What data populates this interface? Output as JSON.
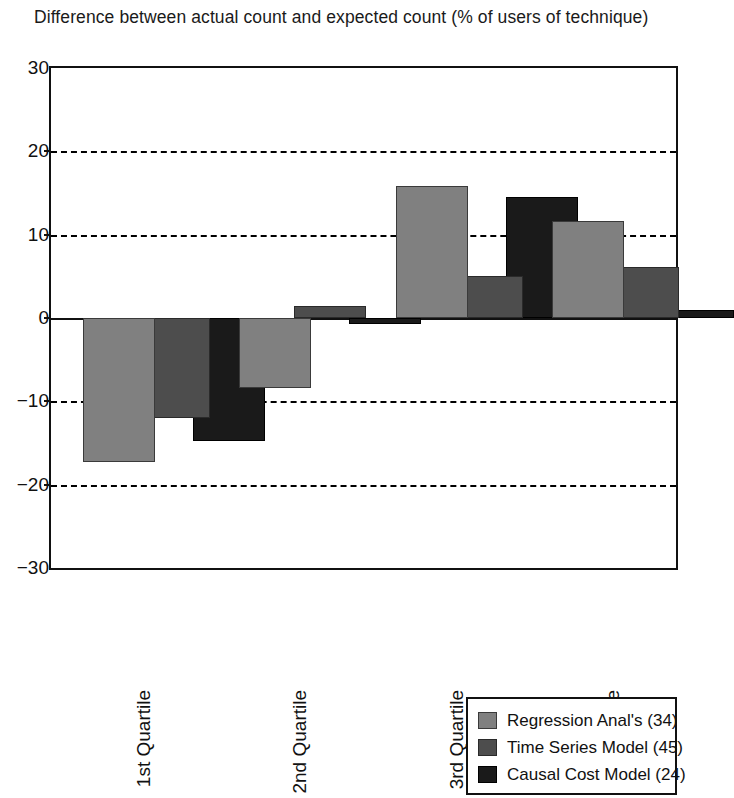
{
  "chart_data": {
    "type": "bar",
    "title": "Difference between actual count and expected count (% of users of technique)",
    "xlabel": "",
    "ylabel": "",
    "ylim": [
      -30,
      30
    ],
    "yticks": [
      30,
      20,
      10,
      0,
      -10,
      -20,
      -30
    ],
    "ytick_labels": [
      "30",
      "20",
      "10",
      "0",
      "−10",
      "−20",
      "−30"
    ],
    "grid": true,
    "grid_axis": "y",
    "legend_position": "bottom-right",
    "categories": [
      "1st Quartile",
      "2nd Quartile",
      "3rd Quartile",
      "4th Quartile"
    ],
    "series": [
      {
        "name": "Regression Anal's (34)",
        "color": "#808080",
        "values": [
          -17.3,
          -8.4,
          15.8,
          11.7
        ]
      },
      {
        "name": "Time Series Model (45)",
        "color": "#4d4d4d",
        "values": [
          -12.0,
          1.5,
          5.0,
          6.1
        ]
      },
      {
        "name": "Causal Cost Model (24)",
        "color": "#1a1a1a",
        "values": [
          -14.7,
          -0.7,
          14.5,
          1.0
        ]
      }
    ]
  },
  "legend": {
    "items": [
      {
        "label": "Regression Anal's (34)",
        "swatch": "#808080"
      },
      {
        "label": "Time Series Model (45)",
        "swatch": "#4d4d4d"
      },
      {
        "label": "Causal Cost Model (24)",
        "swatch": "#1a1a1a"
      }
    ]
  }
}
